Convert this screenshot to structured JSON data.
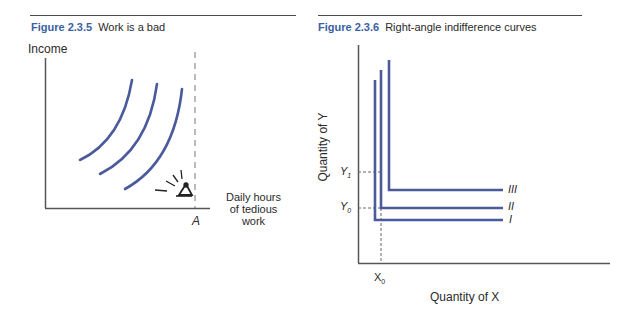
{
  "figures": [
    {
      "number": "Figure 2.3.5",
      "title": "Work is a bad",
      "y_axis_label": "Income",
      "x_axis_label_lines": [
        "Daily hours",
        "of tedious",
        "work"
      ],
      "marker_label": "A",
      "curve_count": 3
    },
    {
      "number": "Figure 2.3.6",
      "title": "Right-angle indifference curves",
      "y_axis_label": "Quantity of Y",
      "x_axis_label": "Quantity of X",
      "ticks": {
        "y1": {
          "base": "Y",
          "sub": "1"
        },
        "y0": {
          "base": "Y",
          "sub": "0"
        },
        "x0": {
          "base": "X",
          "sub": "0"
        }
      },
      "curve_labels": [
        "III",
        "II",
        "I"
      ]
    }
  ],
  "colors": {
    "curve": "#4a5a9a",
    "axis": "#555555",
    "title_accent": "#3b5fa3"
  }
}
